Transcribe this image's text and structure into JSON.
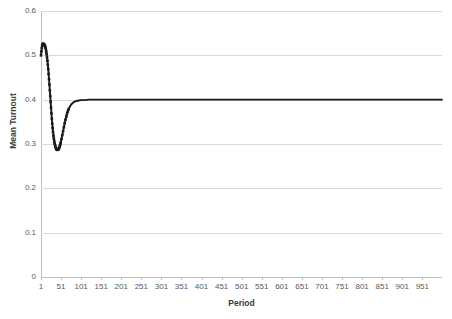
{
  "chart_data": {
    "type": "line",
    "title": "",
    "xlabel": "Period",
    "ylabel": "Mean Turnout",
    "xlim": [
      1,
      1000
    ],
    "ylim": [
      0,
      0.6
    ],
    "grid": true,
    "legend": false,
    "legend_position": "none",
    "line_color": "#1a1a1a",
    "gridline_color": "#d9d9d9",
    "axis_color": "#bfbfbf",
    "marker": "square",
    "ytick_labels": [
      "0.6",
      "0.5",
      "0.4",
      "0.3",
      "0.2",
      "0.1",
      "0"
    ],
    "ytick_values": [
      0.6,
      0.5,
      0.4,
      0.3,
      0.2,
      0.1,
      0
    ],
    "xtick_labels": [
      "1",
      "51",
      "101",
      "151",
      "201",
      "251",
      "301",
      "351",
      "401",
      "451",
      "501",
      "551",
      "601",
      "651",
      "701",
      "751",
      "801",
      "851",
      "901",
      "951"
    ],
    "xtick_values": [
      1,
      51,
      101,
      151,
      201,
      251,
      301,
      351,
      401,
      451,
      501,
      551,
      601,
      651,
      701,
      751,
      801,
      851,
      901,
      951
    ],
    "series": [
      {
        "name": "Mean Turnout",
        "x": [
          1,
          2,
          3,
          4,
          5,
          6,
          7,
          8,
          9,
          10,
          11,
          12,
          13,
          14,
          15,
          16,
          17,
          18,
          19,
          20,
          21,
          22,
          23,
          24,
          25,
          26,
          27,
          28,
          29,
          30,
          31,
          32,
          33,
          34,
          35,
          36,
          37,
          38,
          39,
          40,
          41,
          42,
          43,
          44,
          45,
          46,
          47,
          48,
          49,
          50,
          52,
          54,
          56,
          58,
          60,
          62,
          64,
          66,
          68,
          70,
          74,
          78,
          82,
          86,
          90,
          95,
          100,
          110,
          120,
          130,
          140,
          150,
          175,
          200,
          225,
          250,
          275,
          300,
          325,
          350,
          375,
          400,
          425,
          450,
          475,
          500,
          525,
          550,
          575,
          600,
          625,
          650,
          675,
          700,
          725,
          750,
          775,
          800,
          825,
          850,
          875,
          900,
          925,
          950,
          975,
          1000
        ],
        "y": [
          0.5,
          0.509,
          0.517,
          0.522,
          0.525,
          0.526,
          0.526,
          0.525,
          0.524,
          0.523,
          0.521,
          0.518,
          0.514,
          0.509,
          0.503,
          0.496,
          0.488,
          0.479,
          0.469,
          0.458,
          0.446,
          0.434,
          0.421,
          0.408,
          0.395,
          0.382,
          0.369,
          0.357,
          0.346,
          0.336,
          0.327,
          0.319,
          0.312,
          0.306,
          0.301,
          0.297,
          0.294,
          0.291,
          0.289,
          0.288,
          0.287,
          0.287,
          0.287,
          0.288,
          0.289,
          0.291,
          0.293,
          0.296,
          0.299,
          0.303,
          0.311,
          0.32,
          0.329,
          0.338,
          0.347,
          0.355,
          0.362,
          0.369,
          0.374,
          0.379,
          0.386,
          0.391,
          0.394,
          0.396,
          0.397,
          0.398,
          0.399,
          0.399,
          0.4,
          0.4,
          0.4,
          0.4,
          0.4,
          0.4,
          0.4,
          0.4,
          0.4,
          0.4,
          0.4,
          0.4,
          0.4,
          0.4,
          0.4,
          0.4,
          0.4,
          0.4,
          0.4,
          0.4,
          0.4,
          0.4,
          0.4,
          0.4,
          0.4,
          0.4,
          0.4,
          0.4,
          0.4,
          0.4,
          0.4,
          0.4,
          0.4,
          0.4,
          0.4,
          0.4,
          0.4,
          0.4
        ],
        "initial_value": 0.5,
        "peak_value": 0.526,
        "peak_period": 6,
        "minimum_value": 0.287,
        "minimum_period": 42,
        "steady_state_value": 0.4,
        "final_value": 0.4
      }
    ]
  }
}
